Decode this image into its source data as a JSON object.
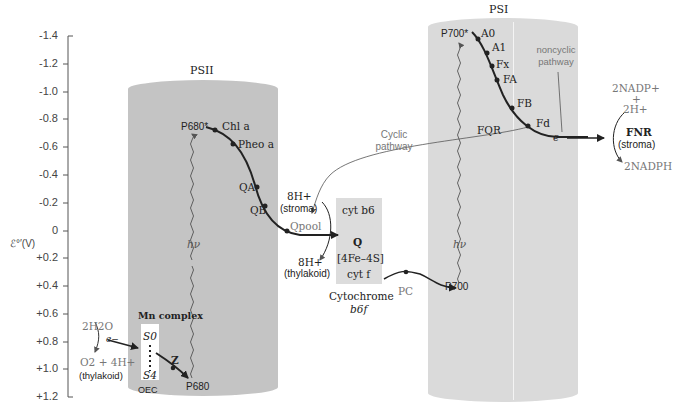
{
  "axis": {
    "label": "ℰ°′(V)",
    "ticks": [
      "-1.4",
      "-1.2",
      "-1.0",
      "-0.8",
      "-0.6",
      "-0.4",
      "-0.2",
      "0",
      "+0.2",
      "+0.4",
      "+0.6",
      "+0.8",
      "+1.0",
      "+1.2"
    ]
  },
  "psii": {
    "title": "PSII",
    "p680_star": "P680*",
    "chl_a": "Chl a",
    "pheo_a": "Pheo a",
    "qa": "QA",
    "qb": "QB",
    "hv": "hν",
    "mn_complex": "Mn complex",
    "s0": "S0",
    "s4": "S4",
    "z": "Z",
    "p680": "P680",
    "oec": "OEC",
    "water": "2H2O",
    "electron": "e−",
    "o2": "O2 + 4H+",
    "thylakoid": "(thylakoid)"
  },
  "cytochrome": {
    "stroma_h": "8H+",
    "stroma": "(stroma)",
    "qpool": "Qpool",
    "thylakoid_h": "8H+",
    "thylakoid": "(thylakoid)",
    "cyt_b6": "cyt b6",
    "q": "Q",
    "fes": "[4Fe–4S]",
    "cyt_f": "cyt f",
    "name_line1": "Cytochrome",
    "name_line2": "b6f",
    "pc": "PC",
    "cyclic": "Cyclic pathway"
  },
  "psi": {
    "title": "PSI",
    "p700_star": "P700*",
    "a0": "A0",
    "a1": "A1",
    "fx": "Fx",
    "fa": "FA",
    "fb": "FB",
    "fd": "Fd",
    "fqr": "FQR",
    "electron": "e−",
    "hv": "hν",
    "p700": "P700",
    "noncyclic": "noncyclic pathway"
  },
  "fnr": {
    "nadp": "2NADP+",
    "plus": "+",
    "h": "2H+",
    "fnr": "FNR",
    "stroma": "(stroma)",
    "nadph": "2NADPH"
  }
}
